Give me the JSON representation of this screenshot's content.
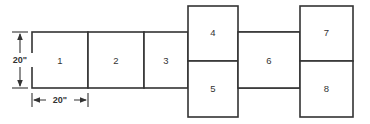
{
  "diagram": {
    "stroke_color": "#333333",
    "fill_color": "#ffffff",
    "background_color": "#ffffff",
    "boxes": [
      {
        "id": "box-1",
        "label": "1",
        "x": 32,
        "y": 32,
        "w": 56,
        "h": 56
      },
      {
        "id": "box-2",
        "label": "2",
        "x": 88,
        "y": 32,
        "w": 56,
        "h": 56
      },
      {
        "id": "box-3",
        "label": "3",
        "x": 144,
        "y": 32,
        "w": 44,
        "h": 56
      },
      {
        "id": "box-4",
        "label": "4",
        "x": 188,
        "y": 6,
        "w": 50,
        "h": 55
      },
      {
        "id": "box-5",
        "label": "5",
        "x": 188,
        "y": 61,
        "w": 50,
        "h": 56
      },
      {
        "id": "box-6",
        "label": "6",
        "x": 238,
        "y": 32,
        "w": 62,
        "h": 56
      },
      {
        "id": "box-7",
        "label": "7",
        "x": 300,
        "y": 6,
        "w": 53,
        "h": 55
      },
      {
        "id": "box-8",
        "label": "8",
        "x": 300,
        "y": 61,
        "w": 53,
        "h": 56
      }
    ],
    "dimensions": {
      "vertical": {
        "label": "20\"",
        "axis_x": 20,
        "from_y": 32,
        "to_y": 88,
        "tick_from_x": 12,
        "tick_to_x": 28
      },
      "horizontal": {
        "label": "20\"",
        "axis_y": 100,
        "from_x": 32,
        "to_x": 88,
        "tick_from_y": 92,
        "tick_to_y": 108
      }
    }
  }
}
